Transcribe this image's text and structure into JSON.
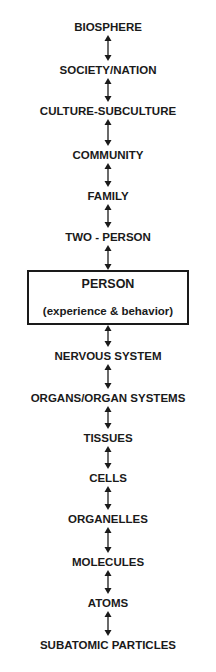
{
  "diagram": {
    "title": "",
    "levels_top": [
      {
        "label": "BIOSPHERE"
      },
      {
        "label": "SOCIETY/NATION"
      },
      {
        "label": "CULTURE-SUBCULTURE"
      },
      {
        "label": "COMMUNITY"
      },
      {
        "label": "FAMILY"
      },
      {
        "label": "TWO - PERSON"
      }
    ],
    "focus": {
      "label": "PERSON",
      "sublabel": "(experience & behavior)"
    },
    "levels_bottom": [
      {
        "label": "NERVOUS SYSTEM"
      },
      {
        "label": "ORGANS/ORGAN SYSTEMS"
      },
      {
        "label": "TISSUES"
      },
      {
        "label": "CELLS"
      },
      {
        "label": "ORGANELLES"
      },
      {
        "label": "MOLECULES"
      },
      {
        "label": "ATOMS"
      },
      {
        "label": "SUBATOMIC PARTICLES"
      }
    ],
    "connector": "double-headed-arrow-icon",
    "colors": {
      "ink": "#1a1a1a",
      "background": "#ffffff"
    }
  }
}
